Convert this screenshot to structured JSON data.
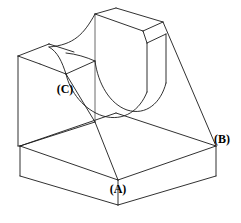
{
  "drawing": {
    "title": "Isometric view of bracket with curved cutout",
    "type": "engineering-isometric-line-drawing",
    "background_color": "#ffffff",
    "line_color": "#1a1a1a",
    "canvas": {
      "width": 241,
      "height": 223
    },
    "labels": [
      {
        "id": "A",
        "text": "(A)",
        "x": 118,
        "y": 190,
        "refers_to": "front-bottom-vertical-edge"
      },
      {
        "id": "B",
        "text": "(B)",
        "x": 222,
        "y": 140,
        "refers_to": "right-side-slant-face-corner"
      },
      {
        "id": "C",
        "text": "(C)",
        "x": 65,
        "y": 90,
        "refers_to": "left-plate-top-inner-edge"
      }
    ],
    "features": [
      "rectangular base block",
      "tall rear vertical plate",
      "left vertical side plate",
      "concave curved cutout",
      "right inclined face"
    ]
  },
  "geometry": {
    "base_top_front": "20,146 118,180 216,146",
    "base_top_back": "20,146 116,113 216,146",
    "base_front_left": "20,146 20,176 118,205 118,180",
    "base_front_right": "118,180 118,205 216,176 216,146",
    "back_plate_top": "95,14 143,31 163,22 116,8",
    "right_slant": "163,22 216,146",
    "left_plate_top": "18,56 49,44 95,60 66,74"
  }
}
